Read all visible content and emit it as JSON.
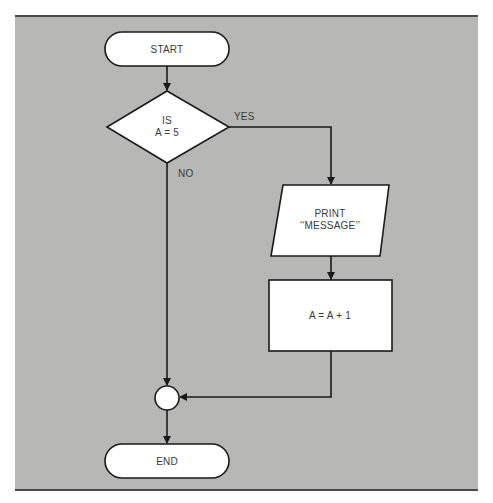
{
  "diagram": {
    "type": "flowchart",
    "colors": {
      "background": "#b7b7b5",
      "border": "#4a4a4a",
      "shape_fill": "#ffffff",
      "stroke": "#1a1a1a",
      "text": "#3a3a3a"
    },
    "nodes": {
      "start": {
        "shape": "terminator",
        "label": "START"
      },
      "decision": {
        "shape": "diamond",
        "line1": "IS",
        "line2": "A = 5"
      },
      "print": {
        "shape": "parallelogram",
        "line1": "PRINT",
        "line2": "‘‘MESSAGE’’"
      },
      "process": {
        "shape": "rectangle",
        "label": "A = A + 1"
      },
      "connector": {
        "shape": "circle",
        "label": ""
      },
      "end": {
        "shape": "terminator",
        "label": "END"
      }
    },
    "edges": {
      "yes_label": "YES",
      "no_label": "NO",
      "list": [
        {
          "from": "start",
          "to": "decision",
          "label": ""
        },
        {
          "from": "decision",
          "to": "print",
          "label": "YES"
        },
        {
          "from": "decision",
          "to": "connector",
          "label": "NO"
        },
        {
          "from": "print",
          "to": "process",
          "label": ""
        },
        {
          "from": "process",
          "to": "connector",
          "label": ""
        },
        {
          "from": "connector",
          "to": "end",
          "label": ""
        }
      ]
    }
  }
}
